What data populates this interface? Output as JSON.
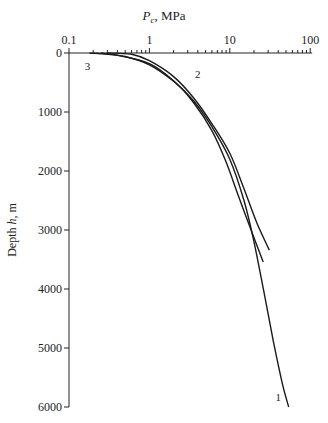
{
  "chart_data": {
    "type": "line",
    "title": "",
    "xlabel": "P_c, MPa",
    "xlabel_main": "P",
    "xlabel_sub": "c",
    "xlabel_rest": ", MPa",
    "ylabel": "Depth h, m",
    "ylabel_pre": "Depth ",
    "ylabel_var": "h",
    "ylabel_post": ", m",
    "x_scale": "log",
    "xlim": [
      0.1,
      100
    ],
    "ylim": [
      0,
      6000
    ],
    "y_inverted": true,
    "x_axis_position": "top",
    "grid": false,
    "x_ticks": [
      0.1,
      1,
      10,
      100
    ],
    "x_tick_labels": [
      "0.1",
      "1",
      "10",
      "100"
    ],
    "y_ticks": [
      0,
      1000,
      2000,
      3000,
      4000,
      5000,
      6000
    ],
    "y_tick_labels": [
      "0",
      "1000",
      "2000",
      "3000",
      "4000",
      "5000",
      "6000"
    ],
    "series": [
      {
        "name": "1",
        "points": [
          [
            0.25,
            0
          ],
          [
            0.5,
            60
          ],
          [
            1.0,
            200
          ],
          [
            2.0,
            480
          ],
          [
            3.5,
            800
          ],
          [
            6,
            1250
          ],
          [
            10,
            1800
          ],
          [
            15,
            2500
          ],
          [
            20,
            3200
          ],
          [
            27,
            4100
          ],
          [
            35,
            4900
          ],
          [
            45,
            5600
          ],
          [
            54,
            6000
          ]
        ]
      },
      {
        "name": "2",
        "points": [
          [
            0.3,
            0
          ],
          [
            0.6,
            20
          ],
          [
            1.0,
            130
          ],
          [
            2.0,
            400
          ],
          [
            3.5,
            750
          ],
          [
            6,
            1200
          ],
          [
            10,
            1700
          ],
          [
            15,
            2300
          ],
          [
            22,
            2900
          ],
          [
            31,
            3340
          ]
        ]
      },
      {
        "name": "3",
        "points": [
          [
            0.18,
            0
          ],
          [
            0.4,
            40
          ],
          [
            1.0,
            180
          ],
          [
            2.0,
            470
          ],
          [
            3.5,
            830
          ],
          [
            6,
            1320
          ],
          [
            9,
            1850
          ],
          [
            13,
            2450
          ],
          [
            19,
            3050
          ],
          [
            26,
            3540
          ]
        ]
      }
    ],
    "annotations": [
      {
        "text": "1",
        "x": 40,
        "y": 5900
      },
      {
        "text": "2",
        "x": 4,
        "y": 420
      },
      {
        "text": "3",
        "x": 0.17,
        "y": 290
      }
    ]
  }
}
